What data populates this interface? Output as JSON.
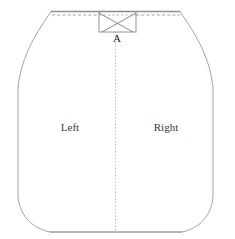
{
  "figure": {
    "name": "garment-pattern-diagram",
    "width": 235,
    "height": 239,
    "background_color": "#ffffff"
  },
  "colors": {
    "outline": "#9a9a9a",
    "top_edge": "#8f8f8f",
    "dashed_guide": "#8a8a8a",
    "center_fold": "#a8a8a8",
    "box_stroke": "#8a8a8a",
    "box_cross": "#6f6f6f",
    "label_text": "#3a3a3a",
    "point_text": "#1d1d1d"
  },
  "labels": {
    "left_panel": "Left",
    "right_panel": "Right",
    "point_a": "A"
  },
  "geometry": {
    "top_edge": {
      "x1": 51,
      "y1": 11.5,
      "x2": 180,
      "y2": 11.5
    },
    "dashed_guide": {
      "x1": 52,
      "y1": 15,
      "x2": 180,
      "y2": 15
    },
    "center_fold": {
      "x": 115.5,
      "y1": 32,
      "y2": 232
    },
    "bottom_edge": {
      "x1": 50,
      "y1": 232,
      "x2": 182,
      "y2": 232
    },
    "left_side": {
      "x": 18,
      "y1": 87,
      "y2": 196
    },
    "right_side": {
      "x": 213,
      "y1": 87,
      "y2": 196
    },
    "notch_box": {
      "x": 99,
      "y": 11.5,
      "width": 37,
      "height": 20.5
    }
  },
  "label_positions": {
    "left_panel": {
      "x": 70,
      "y": 128
    },
    "right_panel": {
      "x": 166,
      "y": 128
    },
    "point_a": {
      "x": 117,
      "y": 39
    }
  }
}
